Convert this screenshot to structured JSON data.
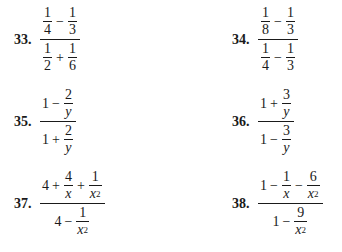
{
  "problems": [
    {
      "number": "33.",
      "expression": "(1/4 − 1/3) / (1/2 + 1/6)",
      "numerator": {
        "a": {
          "n": "1",
          "d": "4"
        },
        "op": "−",
        "b": {
          "n": "1",
          "d": "3"
        }
      },
      "denominator": {
        "a": {
          "n": "1",
          "d": "2"
        },
        "op": "+",
        "b": {
          "n": "1",
          "d": "6"
        }
      }
    },
    {
      "number": "34.",
      "expression": "(1/8 − 1/3) / (1/4 − 1/3)",
      "numerator": {
        "a": {
          "n": "1",
          "d": "8"
        },
        "op": "−",
        "b": {
          "n": "1",
          "d": "3"
        }
      },
      "denominator": {
        "a": {
          "n": "1",
          "d": "4"
        },
        "op": "−",
        "b": {
          "n": "1",
          "d": "3"
        }
      }
    },
    {
      "number": "35.",
      "expression": "(1 − 2/y) / (1 + 2/y)",
      "numerator": {
        "lead": "1",
        "op": "−",
        "b": {
          "n": "2",
          "d": "y"
        }
      },
      "denominator": {
        "lead": "1",
        "op": "+",
        "b": {
          "n": "2",
          "d": "y"
        }
      }
    },
    {
      "number": "36.",
      "expression": "(1 + 3/y) / (1 − 3/y)",
      "numerator": {
        "lead": "1",
        "op": "+",
        "b": {
          "n": "3",
          "d": "y"
        }
      },
      "denominator": {
        "lead": "1",
        "op": "−",
        "b": {
          "n": "3",
          "d": "y"
        }
      }
    },
    {
      "number": "37.",
      "expression": "(4 + 4/x + 1/x²) / (4 − 1/x²)",
      "numerator": {
        "lead": "4",
        "op1": "+",
        "b": {
          "n": "4",
          "d": "x"
        },
        "op2": "+",
        "c": {
          "n": "1",
          "d": "x",
          "exp": "2"
        }
      },
      "denominator": {
        "lead": "4",
        "op": "−",
        "b": {
          "n": "1",
          "d": "x",
          "exp": "2"
        }
      }
    },
    {
      "number": "38.",
      "expression": "(1 − 1/x − 6/x²) / (1 − 9/x²)",
      "numerator": {
        "lead": "1",
        "op1": "−",
        "b": {
          "n": "1",
          "d": "x"
        },
        "op2": "−",
        "c": {
          "n": "6",
          "d": "x",
          "exp": "2"
        }
      },
      "denominator": {
        "lead": "1",
        "op": "−",
        "b": {
          "n": "9",
          "d": "x",
          "exp": "2"
        }
      }
    }
  ]
}
